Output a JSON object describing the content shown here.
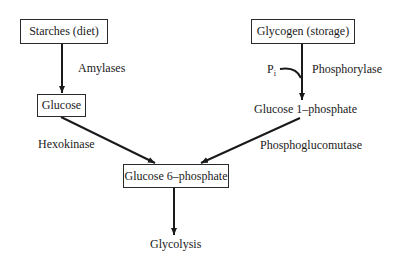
{
  "diagram": {
    "nodes": {
      "starches": {
        "label": "Starches (diet)",
        "boxed": true
      },
      "glycogen": {
        "label": "Glycogen (storage)",
        "boxed": true
      },
      "glucose": {
        "label": "Glucose",
        "boxed": true
      },
      "glucose_1_phosphate": {
        "label": "Glucose 1–phosphate",
        "boxed": false
      },
      "glucose_6_phosphate": {
        "label": "Glucose 6–phosphate",
        "boxed": true
      },
      "glycolysis": {
        "label": "Glycolysis",
        "boxed": false
      }
    },
    "edges": {
      "amylases": {
        "from": "Starches (diet)",
        "to": "Glucose",
        "label": "Amylases"
      },
      "phosphorylase": {
        "from": "Glycogen (storage)",
        "to": "Glucose 1–phosphate",
        "label": "Phosphorylase"
      },
      "hexokinase": {
        "from": "Glucose",
        "to": "Glucose 6–phosphate",
        "label": "Hexokinase"
      },
      "phosphoglucomutase": {
        "from": "Glucose 1–phosphate",
        "to": "Glucose 6–phosphate",
        "label": "Phosphoglucomutase"
      },
      "glycolysis": {
        "from": "Glucose 6–phosphate",
        "to": "Glycolysis",
        "label": ""
      }
    },
    "cofactor": {
      "symbol": "P",
      "subscript": "i",
      "joins_edge": "Phosphorylase"
    },
    "colors": {
      "line": "#1a1a1a",
      "box_border": "#2a2a2a",
      "background": "#ffffff"
    }
  }
}
